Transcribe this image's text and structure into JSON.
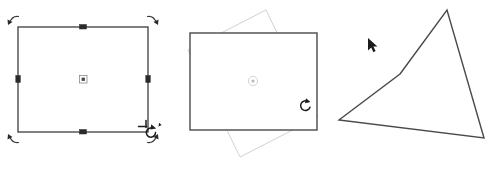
{
  "illustration": {
    "title": "Rotate object interaction sequence",
    "background_color": "#ffffff",
    "width": 490,
    "height": 173,
    "panel_count": 3
  },
  "colors": {
    "shape_stroke": "#4a4a4a",
    "ghost_stroke": "#d2d2d2",
    "handle_fill": "#2b2b2b",
    "cursor_color": "#1c1c1c",
    "canvas": "#ffffff"
  },
  "panels": [
    {
      "id": "panel-select",
      "name": "selected-state",
      "caption": "",
      "shape": {
        "name": "rectangle",
        "x": 18,
        "y": 27,
        "width": 130,
        "height": 105,
        "rotation_deg": 0
      },
      "pivot": {
        "x": 83,
        "y": 79,
        "label": "rotation-center"
      },
      "edge_handles": [
        {
          "name": "handle-top-middle",
          "x": 83,
          "y": 27
        },
        {
          "name": "handle-bottom-middle",
          "x": 83,
          "y": 132
        },
        {
          "name": "handle-left-middle",
          "x": 18,
          "y": 79
        },
        {
          "name": "handle-right-middle",
          "x": 148,
          "y": 79
        }
      ],
      "corner_handles": [
        {
          "name": "rotate-handle-top-left",
          "x": 18,
          "y": 27
        },
        {
          "name": "rotate-handle-top-right",
          "x": 148,
          "y": 27
        },
        {
          "name": "rotate-handle-bottom-left",
          "x": 18,
          "y": 132
        },
        {
          "name": "rotate-handle-bottom-right",
          "x": 148,
          "y": 132
        }
      ],
      "cursor": {
        "type": "rotate-cursor",
        "x": 150,
        "y": 133
      }
    },
    {
      "id": "panel-rotate",
      "name": "dragging-state",
      "caption": "",
      "shape": {
        "name": "rectangle",
        "x": 20,
        "y": 33,
        "width": 127,
        "height": 97,
        "rotation_deg": 0
      },
      "ghost": {
        "name": "rotation-preview-outline",
        "rotation_deg": -17,
        "points": "18,50 96,10 148,117 70,157"
      },
      "pivot": {
        "x": 83,
        "y": 81,
        "label": "rotation-center"
      },
      "cursor": {
        "type": "rotate-cursor",
        "x": 137,
        "y": 105
      }
    },
    {
      "id": "panel-result",
      "name": "rotated-result-state",
      "caption": "",
      "shape": {
        "name": "rotated-rectangle",
        "rotation_deg": -42,
        "points": "68,74 115,10 152,138 7,120"
      },
      "cursor": {
        "type": "arrow-cursor",
        "x": 42,
        "y": 44
      }
    }
  ],
  "icons": {
    "rotate_cursor": "rotate-cursor",
    "arrow_cursor": "arrow-cursor",
    "pivot_marker": "rotation-center-icon",
    "edge_handle": "resize-handle-icon",
    "corner_handle": "rotate-handle-icon"
  }
}
